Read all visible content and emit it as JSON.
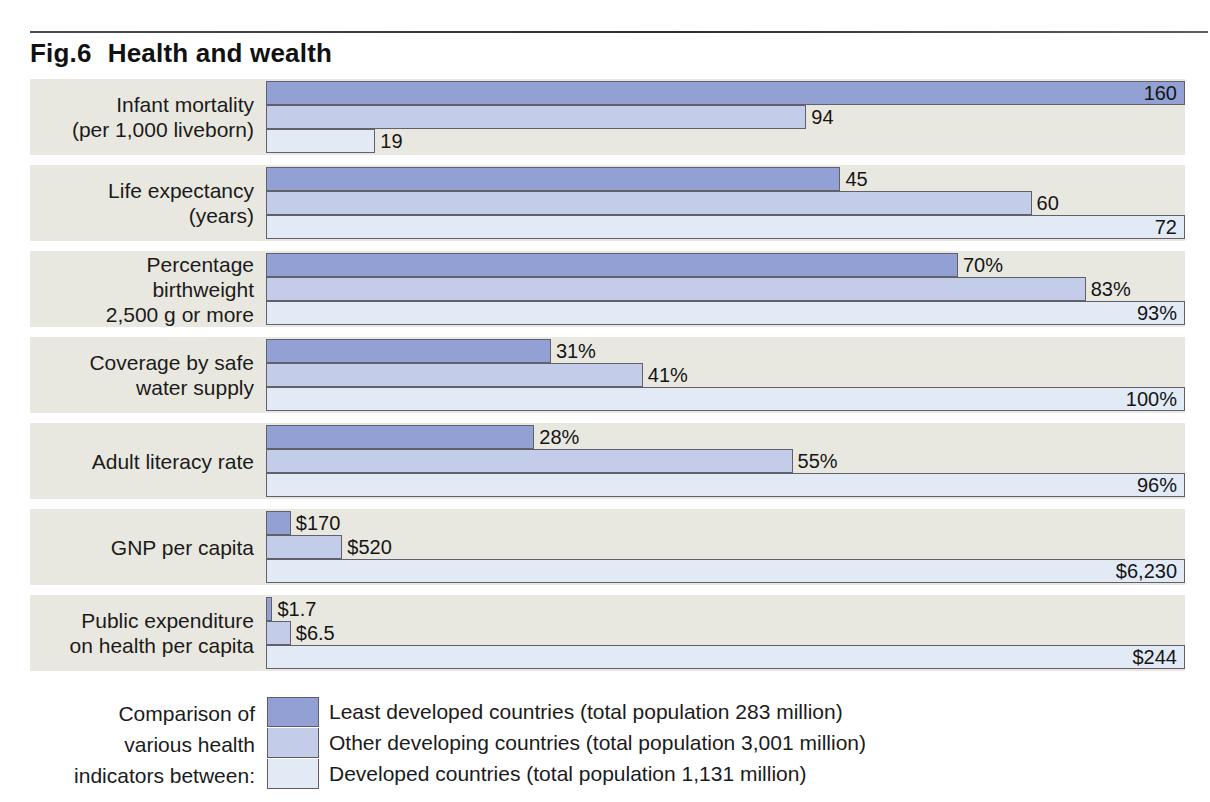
{
  "figure": {
    "number": "Fig.6",
    "title": "Health and wealth"
  },
  "legend": {
    "caption_lines": [
      "Comparison of",
      "various health",
      "indicators between:"
    ],
    "entries": [
      {
        "label": "Least developed countries (total population 283 million)",
        "color": "#93a0d4"
      },
      {
        "label": "Other developing countries (total population 3,001 million)",
        "color": "#c3cdea"
      },
      {
        "label": "Developed countries (total population 1,131 million)",
        "color": "#e2eaf6"
      }
    ]
  },
  "chart_data": {
    "type": "bar",
    "orientation": "horizontal",
    "xlabel": "",
    "ylabel": "",
    "grid": false,
    "legend_position": "bottom",
    "note": "Each indicator row is scaled independently; the largest bar in each row spans the full plot width.",
    "series": [
      {
        "name": "Least developed countries (total population 283 million)",
        "color": "#93a0d4"
      },
      {
        "name": "Other developing countries (total population 3,001 million)",
        "color": "#c3cdea"
      },
      {
        "name": "Developed countries (total population 1,131 million)",
        "color": "#e2eaf6"
      }
    ],
    "categories": [
      "Infant mortality (per 1,000 liveborn)",
      "Life expectancy (years)",
      "Percentage birthweight 2,500 g or more",
      "Coverage by safe water supply",
      "Adult literacy rate",
      "GNP per capita",
      "Public expenditure on health per capita"
    ],
    "groups": [
      {
        "label_lines": [
          "Infant mortality",
          "(per 1,000 liveborn)"
        ],
        "row_max": 160,
        "bars": [
          {
            "series": 0,
            "value": 160,
            "label": "160",
            "pct": 100.0,
            "label_inside": true
          },
          {
            "series": 1,
            "value": 94,
            "label": "94",
            "pct": 58.8,
            "label_inside": false
          },
          {
            "series": 2,
            "value": 19,
            "label": "19",
            "pct": 11.9,
            "label_inside": false
          }
        ]
      },
      {
        "label_lines": [
          "Life expectancy",
          "(years)"
        ],
        "row_max": 72,
        "bars": [
          {
            "series": 0,
            "value": 45,
            "label": "45",
            "pct": 62.5,
            "label_inside": false
          },
          {
            "series": 1,
            "value": 60,
            "label": "60",
            "pct": 83.3,
            "label_inside": false
          },
          {
            "series": 2,
            "value": 72,
            "label": "72",
            "pct": 100.0,
            "label_inside": true
          }
        ]
      },
      {
        "label_lines": [
          "Percentage",
          "birthweight",
          "2,500 g or more"
        ],
        "row_max": 93,
        "bars": [
          {
            "series": 0,
            "value": 70,
            "label": "70%",
            "pct": 75.3,
            "label_inside": false
          },
          {
            "series": 1,
            "value": 83,
            "label": "83%",
            "pct": 89.2,
            "label_inside": false
          },
          {
            "series": 2,
            "value": 93,
            "label": "93%",
            "pct": 100.0,
            "label_inside": true
          }
        ]
      },
      {
        "label_lines": [
          "Coverage by safe",
          "water supply"
        ],
        "row_max": 100,
        "bars": [
          {
            "series": 0,
            "value": 31,
            "label": "31%",
            "pct": 31.0,
            "label_inside": false
          },
          {
            "series": 1,
            "value": 41,
            "label": "41%",
            "pct": 41.0,
            "label_inside": false
          },
          {
            "series": 2,
            "value": 100,
            "label": "100%",
            "pct": 100.0,
            "label_inside": true
          }
        ]
      },
      {
        "label_lines": [
          "Adult literacy rate"
        ],
        "row_max": 96,
        "bars": [
          {
            "series": 0,
            "value": 28,
            "label": "28%",
            "pct": 29.2,
            "label_inside": false
          },
          {
            "series": 1,
            "value": 55,
            "label": "55%",
            "pct": 57.3,
            "label_inside": false
          },
          {
            "series": 2,
            "value": 96,
            "label": "96%",
            "pct": 100.0,
            "label_inside": true
          }
        ]
      },
      {
        "label_lines": [
          "GNP per capita"
        ],
        "row_max": 6230,
        "bars": [
          {
            "series": 0,
            "value": 170,
            "label": "$170",
            "pct": 2.7,
            "label_inside": false
          },
          {
            "series": 1,
            "value": 520,
            "label": "$520",
            "pct": 8.3,
            "label_inside": false
          },
          {
            "series": 2,
            "value": 6230,
            "label": "$6,230",
            "pct": 100.0,
            "label_inside": true
          }
        ]
      },
      {
        "label_lines": [
          "Public expenditure",
          "on health per capita"
        ],
        "row_max": 244,
        "bars": [
          {
            "series": 0,
            "value": 1.7,
            "label": "$1.7",
            "pct": 0.7,
            "label_inside": false
          },
          {
            "series": 1,
            "value": 6.5,
            "label": "$6.5",
            "pct": 2.7,
            "label_inside": false
          },
          {
            "series": 2,
            "value": 244,
            "label": "$244",
            "pct": 100.0,
            "label_inside": true
          }
        ]
      }
    ]
  }
}
